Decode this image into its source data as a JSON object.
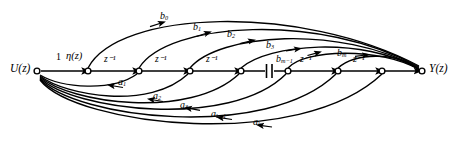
{
  "figure": {
    "type": "signal-flow-graph",
    "background_color": "#ffffff",
    "line_color": "#000000"
  },
  "terminals": {
    "input_label": "U(z)",
    "output_label": "Y(z)"
  },
  "input_branch": {
    "gain_label": "1",
    "transfer_label": "η(z)"
  },
  "delay_label": "z⁻¹",
  "delays": [
    {
      "label": "z⁻¹"
    },
    {
      "label": "z⁻¹"
    },
    {
      "label": "z⁻¹"
    },
    {
      "label": "z⁻¹"
    },
    {
      "label": "z⁻¹"
    }
  ],
  "feedforward_coefficients": [
    {
      "label": "b",
      "sub": "0"
    },
    {
      "label": "b",
      "sub": "1"
    },
    {
      "label": "b",
      "sub": "2"
    },
    {
      "label": "b",
      "sub": "3"
    },
    {
      "label": "b",
      "sub": "m−1"
    },
    {
      "label": "b",
      "sub": "m"
    }
  ],
  "feedback_coefficients": [
    {
      "label": "a",
      "sub": "1"
    },
    {
      "label": "a",
      "sub": "2"
    },
    {
      "label": "a",
      "sub": "3"
    },
    {
      "label": "a",
      "sub": "k−1"
    },
    {
      "label": "a",
      "sub": "k"
    }
  ],
  "ellipsis_break": {
    "name": "chain-break",
    "symbol": "||"
  },
  "nodes": [
    {
      "name": "node-u",
      "x": 37,
      "y": 71
    },
    {
      "name": "node-1",
      "x": 88,
      "y": 71
    },
    {
      "name": "node-2",
      "x": 139,
      "y": 71
    },
    {
      "name": "node-3",
      "x": 190,
      "y": 71
    },
    {
      "name": "node-4",
      "x": 241,
      "y": 71
    },
    {
      "name": "node-5",
      "x": 288,
      "y": 71
    },
    {
      "name": "node-6",
      "x": 338,
      "y": 71
    },
    {
      "name": "node-7",
      "x": 382,
      "y": 71
    },
    {
      "name": "node-y",
      "x": 422,
      "y": 71
    }
  ]
}
